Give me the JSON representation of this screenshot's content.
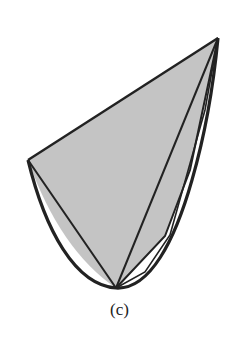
{
  "figure": {
    "caption": "(c)",
    "fill_color": "#c4c4c4",
    "stroke_color": "#222222",
    "vertices": {
      "top_right": [
        218,
        38
      ],
      "left": [
        28,
        160
      ],
      "bottom": [
        116,
        288
      ]
    }
  }
}
